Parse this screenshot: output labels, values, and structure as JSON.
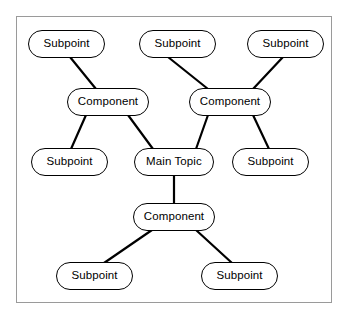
{
  "diagram": {
    "type": "mind-map",
    "title": "",
    "background_color": "#ffffff",
    "frame_color": "#9a9a9a",
    "node_fill": "#ffffff",
    "node_stroke": "#000000",
    "edge_color": "#000000",
    "nodes": [
      {
        "id": "sub_tl",
        "label": "Subpoint",
        "role": "subpoint",
        "x": 28,
        "y": 30,
        "w": 77,
        "h": 28
      },
      {
        "id": "sub_tm",
        "label": "Subpoint",
        "role": "subpoint",
        "x": 139,
        "y": 30,
        "w": 77,
        "h": 28
      },
      {
        "id": "sub_tr",
        "label": "Subpoint",
        "role": "subpoint",
        "x": 247,
        "y": 30,
        "w": 77,
        "h": 28
      },
      {
        "id": "comp_l",
        "label": "Component",
        "role": "component",
        "x": 67,
        "y": 88,
        "w": 82,
        "h": 28
      },
      {
        "id": "comp_r",
        "label": "Component",
        "role": "component",
        "x": 189,
        "y": 88,
        "w": 82,
        "h": 28
      },
      {
        "id": "sub_ml",
        "label": "Subpoint",
        "role": "subpoint",
        "x": 31,
        "y": 148,
        "w": 77,
        "h": 28
      },
      {
        "id": "main",
        "label": "Main Topic",
        "role": "main",
        "x": 134,
        "y": 148,
        "w": 80,
        "h": 28
      },
      {
        "id": "sub_mr",
        "label": "Subpoint",
        "role": "subpoint",
        "x": 232,
        "y": 148,
        "w": 77,
        "h": 28
      },
      {
        "id": "comp_b",
        "label": "Component",
        "role": "component",
        "x": 133,
        "y": 203,
        "w": 82,
        "h": 28
      },
      {
        "id": "sub_bl",
        "label": "Subpoint",
        "role": "subpoint",
        "x": 56,
        "y": 262,
        "w": 77,
        "h": 28
      },
      {
        "id": "sub_br",
        "label": "Subpoint",
        "role": "subpoint",
        "x": 201,
        "y": 262,
        "w": 77,
        "h": 28
      }
    ],
    "edges": [
      {
        "from": "sub_tl",
        "to": "comp_l",
        "x1": 70,
        "y1": 57,
        "x2": 96,
        "y2": 89
      },
      {
        "from": "sub_tm",
        "to": "comp_r",
        "x1": 168,
        "y1": 57,
        "x2": 208,
        "y2": 89
      },
      {
        "from": "sub_tr",
        "to": "comp_r",
        "x1": 283,
        "y1": 57,
        "x2": 253,
        "y2": 89
      },
      {
        "from": "comp_l",
        "to": "sub_ml",
        "x1": 86,
        "y1": 115,
        "x2": 71,
        "y2": 149
      },
      {
        "from": "comp_l",
        "to": "main",
        "x1": 128,
        "y1": 115,
        "x2": 153,
        "y2": 149
      },
      {
        "from": "comp_r",
        "to": "main",
        "x1": 208,
        "y1": 115,
        "x2": 196,
        "y2": 149
      },
      {
        "from": "comp_r",
        "to": "sub_mr",
        "x1": 253,
        "y1": 115,
        "x2": 269,
        "y2": 149
      },
      {
        "from": "main",
        "to": "comp_b",
        "x1": 174,
        "y1": 176,
        "x2": 174,
        "y2": 203
      },
      {
        "from": "comp_b",
        "to": "sub_bl",
        "x1": 152,
        "y1": 230,
        "x2": 104,
        "y2": 263
      },
      {
        "from": "comp_b",
        "to": "sub_br",
        "x1": 196,
        "y1": 230,
        "x2": 232,
        "y2": 263
      }
    ]
  }
}
